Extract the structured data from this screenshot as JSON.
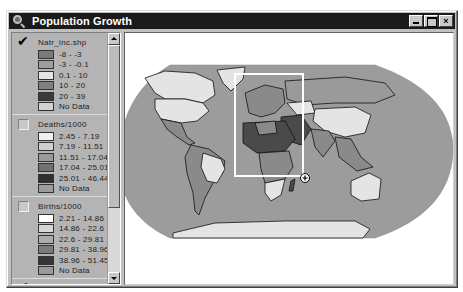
{
  "window": {
    "title": "Population Growth",
    "icon": "magnifier-icon",
    "buttons": [
      {
        "name": "minimize",
        "icon": "minimize-icon"
      },
      {
        "name": "maximize",
        "icon": "maximize-icon"
      },
      {
        "name": "close",
        "icon": "close-icon",
        "glyph": "×"
      }
    ]
  },
  "legend": {
    "themes": [
      {
        "label": "Natr_inc.shp",
        "checked": true,
        "classes": [
          {
            "label": "-8 - -3",
            "color": "#7a7a7a"
          },
          {
            "label": "-3 - -0.1",
            "color": "#9e9e9e"
          },
          {
            "label": "0.1 - 10",
            "color": "#e6e6e6"
          },
          {
            "label": "10 - 20",
            "color": "#808080"
          },
          {
            "label": "20 - 39",
            "color": "#3a3a3a"
          },
          {
            "label": "No Data",
            "color": "#d2d2d2"
          }
        ]
      },
      {
        "label": "Deaths/1000",
        "checked": false,
        "classes": [
          {
            "label": "2.45 - 7.19",
            "color": "#f0f0f0"
          },
          {
            "label": "7.19 - 11.51",
            "color": "#cfcfcf"
          },
          {
            "label": "11.51 - 17.04",
            "color": "#9a9a9a"
          },
          {
            "label": "17.04 - 25.01",
            "color": "#707070"
          },
          {
            "label": "25.01 - 46.44",
            "color": "#303030"
          },
          {
            "label": "No Data",
            "color": "#9c9c9c"
          }
        ]
      },
      {
        "label": "Births/1000",
        "checked": false,
        "classes": [
          {
            "label": "2.21 - 14.86",
            "color": "#ffffff"
          },
          {
            "label": "14.86 - 22.6",
            "color": "#d6d6d6"
          },
          {
            "label": "22.6 - 29.81",
            "color": "#acacac"
          },
          {
            "label": "29.81 - 38.96",
            "color": "#7c7c7c"
          },
          {
            "label": "38.96 - 51.45",
            "color": "#363636"
          },
          {
            "label": "No Data",
            "color": "#9a9a9a"
          }
        ]
      },
      {
        "label": "Countries",
        "checked": true,
        "classes": [
          {
            "label": "",
            "color": "#ffffff"
          }
        ]
      }
    ]
  },
  "map": {
    "ocean_color": "#9c9c9c",
    "land_light": "#e4e4e4",
    "land_mid": "#8a8a8a",
    "land_dark": "#4a4a4a",
    "zoom_box": {
      "stroke": "#ffffff"
    },
    "cursor": "zoom-in-cursor-icon"
  }
}
